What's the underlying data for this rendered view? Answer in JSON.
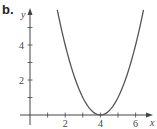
{
  "panel_label": "b.",
  "chart_data": {
    "type": "line",
    "title": "",
    "function": "y = (x - 4)^2",
    "xlabel": "x",
    "ylabel": "y",
    "xlim": [
      0,
      7
    ],
    "ylim": [
      0,
      6
    ],
    "x_ticks": [
      1,
      2,
      3,
      4,
      5,
      6
    ],
    "x_tick_labels": [
      "2",
      "4",
      "6"
    ],
    "y_ticks": [
      1,
      2,
      3,
      4,
      5
    ],
    "y_tick_labels": [
      "2",
      "4"
    ],
    "grid": false,
    "legend": null,
    "series": [
      {
        "name": "parabola",
        "x": [
          1.55,
          2,
          2.5,
          3,
          3.5,
          4,
          4.5,
          5,
          5.5,
          6,
          6.45
        ],
        "y": [
          6.0,
          4,
          2.25,
          1,
          0.25,
          0,
          0.25,
          1,
          2.25,
          4,
          6.0
        ]
      }
    ],
    "colors": {
      "curve": "#555555",
      "axis": "#444444"
    }
  }
}
